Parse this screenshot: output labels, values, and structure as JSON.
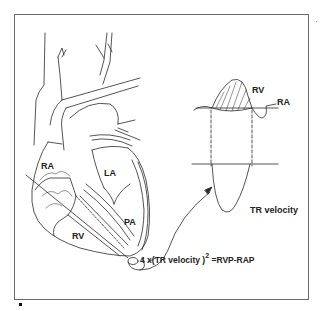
{
  "figure": {
    "heart_labels": {
      "ra": "RA",
      "la": "LA",
      "rv": "RV",
      "pa": "PA"
    },
    "pressure_trace": {
      "rv_label": "RV",
      "ra_label": "RA"
    },
    "doppler_trace": {
      "label": "TR velocity"
    },
    "formula": {
      "prefix": "4 x(TR velocity )",
      "exponent": "2",
      "suffix": " =RVP-RAP"
    },
    "colors": {
      "line": "#2a2a2a",
      "frame": "#6a6a6a",
      "background": "#ffffff"
    }
  }
}
